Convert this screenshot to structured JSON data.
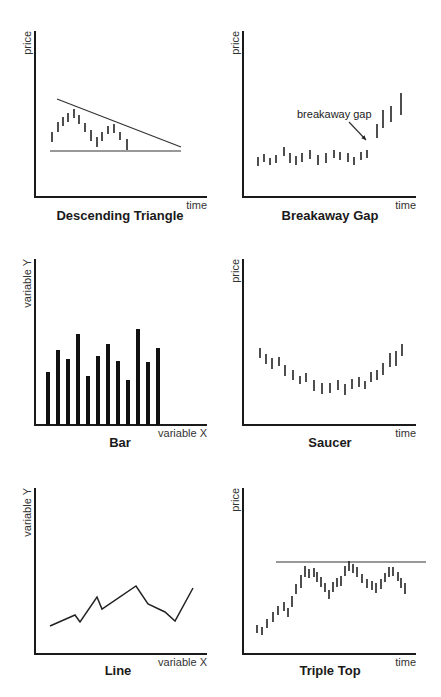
{
  "chart_data": [
    {
      "id": "descending-triangle",
      "type": "bar-range",
      "title": "Descending Triangle",
      "ylabel": "price",
      "xlabel": "time",
      "origin": [
        35,
        197
      ],
      "y_top": 31,
      "x_end": 207,
      "title_pos": [
        120,
        220
      ],
      "ranges": [
        [
          52,
          132,
          142
        ],
        [
          58,
          122,
          132
        ],
        [
          63,
          117,
          126
        ],
        [
          68,
          113,
          122
        ],
        [
          74,
          109,
          118
        ],
        [
          79,
          115,
          124
        ],
        [
          85,
          123,
          132
        ],
        [
          91,
          130,
          141
        ],
        [
          97,
          137,
          147
        ],
        [
          102,
          132,
          141
        ],
        [
          108,
          126,
          134
        ],
        [
          114,
          124,
          133
        ],
        [
          120,
          132,
          140
        ],
        [
          127,
          139,
          150
        ]
      ],
      "lines": [
        [
          57,
          99,
          181,
          147
        ],
        [
          50,
          151,
          181,
          151
        ]
      ]
    },
    {
      "id": "breakaway-gap",
      "type": "bar-range",
      "title": "Breakaway Gap",
      "ylabel": "price",
      "xlabel": "time",
      "origin": [
        243,
        197
      ],
      "y_top": 31,
      "x_end": 416,
      "title_pos": [
        330,
        220
      ],
      "ranges": [
        [
          258,
          157,
          166
        ],
        [
          264,
          154,
          162
        ],
        [
          270,
          158,
          165
        ],
        [
          276,
          155,
          163
        ],
        [
          284,
          147,
          156
        ],
        [
          290,
          153,
          163
        ],
        [
          296,
          156,
          165
        ],
        [
          302,
          153,
          162
        ],
        [
          310,
          150,
          159
        ],
        [
          318,
          155,
          165
        ],
        [
          326,
          153,
          163
        ],
        [
          334,
          150,
          158
        ],
        [
          340,
          152,
          160
        ],
        [
          348,
          153,
          162
        ],
        [
          354,
          157,
          165
        ],
        [
          361,
          152,
          160
        ],
        [
          367,
          150,
          158
        ],
        [
          377,
          124,
          138
        ],
        [
          383,
          110,
          128
        ],
        [
          391,
          106,
          122
        ],
        [
          401,
          93,
          115
        ]
      ],
      "lines": [],
      "annotation": {
        "text": "breakaway gap",
        "pos": [
          297,
          118
        ],
        "arrow": [
          349,
          122,
          366,
          140
        ]
      }
    },
    {
      "id": "bar",
      "type": "bar",
      "title": "Bar",
      "ylabel": "variable Y",
      "xlabel": "variable X",
      "origin": [
        35,
        425
      ],
      "y_top": 259,
      "x_end": 207,
      "title_pos": [
        120,
        447
      ],
      "categories": [
        "1",
        "2",
        "3",
        "4",
        "5",
        "6",
        "7",
        "8",
        "9",
        "10",
        "11",
        "12"
      ],
      "x": [
        48,
        58,
        68,
        78,
        88,
        98,
        108,
        118,
        128,
        138,
        148,
        158
      ],
      "values": [
        53,
        75,
        66,
        91,
        49,
        69,
        81,
        64,
        45,
        96,
        63,
        77
      ],
      "ylim": [
        0,
        166
      ]
    },
    {
      "id": "saucer",
      "type": "bar-range",
      "title": "Saucer",
      "ylabel": "price",
      "xlabel": "time",
      "origin": [
        243,
        425
      ],
      "y_top": 259,
      "x_end": 416,
      "title_pos": [
        330,
        447
      ],
      "ranges": [
        [
          260,
          348,
          358
        ],
        [
          266,
          354,
          364
        ],
        [
          272,
          358,
          369
        ],
        [
          279,
          357,
          366
        ],
        [
          285,
          365,
          376
        ],
        [
          293,
          370,
          380
        ],
        [
          300,
          376,
          384
        ],
        [
          306,
          373,
          382
        ],
        [
          314,
          380,
          391
        ],
        [
          322,
          383,
          394
        ],
        [
          330,
          383,
          393
        ],
        [
          338,
          380,
          390
        ],
        [
          345,
          384,
          395
        ],
        [
          352,
          379,
          389
        ],
        [
          359,
          377,
          387
        ],
        [
          365,
          381,
          389
        ],
        [
          371,
          372,
          382
        ],
        [
          377,
          370,
          380
        ],
        [
          383,
          363,
          375
        ],
        [
          390,
          353,
          367
        ],
        [
          396,
          351,
          366
        ],
        [
          402,
          344,
          356
        ]
      ],
      "lines": []
    },
    {
      "id": "line",
      "type": "line",
      "title": "Line",
      "ylabel": "variable Y",
      "xlabel": "variable X",
      "origin": [
        35,
        654
      ],
      "y_top": 488,
      "x_end": 207,
      "title_pos": [
        118,
        675
      ],
      "points": [
        [
          50,
          626
        ],
        [
          75,
          615
        ],
        [
          80,
          622
        ],
        [
          97,
          597
        ],
        [
          102,
          609
        ],
        [
          136,
          586
        ],
        [
          148,
          604
        ],
        [
          165,
          612
        ],
        [
          175,
          621
        ],
        [
          193,
          588
        ]
      ]
    },
    {
      "id": "triple-top",
      "type": "bar-range",
      "title": "Triple Top",
      "ylabel": "price",
      "xlabel": "time",
      "origin": [
        243,
        654
      ],
      "y_top": 488,
      "x_end": 416,
      "title_pos": [
        330,
        675
      ],
      "ranges": [
        [
          257,
          625,
          633
        ],
        [
          262,
          627,
          635
        ],
        [
          267,
          619,
          628
        ],
        [
          273,
          612,
          622
        ],
        [
          278,
          606,
          615
        ],
        [
          284,
          602,
          611
        ],
        [
          288,
          608,
          617
        ],
        [
          292,
          596,
          607
        ],
        [
          296,
          584,
          594
        ],
        [
          301,
          575,
          588
        ],
        [
          305,
          566,
          577
        ],
        [
          309,
          569,
          578
        ],
        [
          314,
          568,
          577
        ],
        [
          317,
          572,
          582
        ],
        [
          321,
          577,
          587
        ],
        [
          325,
          583,
          592
        ],
        [
          329,
          590,
          599
        ],
        [
          333,
          582,
          592
        ],
        [
          337,
          578,
          587
        ],
        [
          341,
          576,
          586
        ],
        [
          345,
          566,
          576
        ],
        [
          349,
          561,
          571
        ],
        [
          353,
          564,
          573
        ],
        [
          357,
          567,
          577
        ],
        [
          362,
          574,
          583
        ],
        [
          367,
          579,
          588
        ],
        [
          372,
          581,
          590
        ],
        [
          376,
          583,
          593
        ],
        [
          381,
          579,
          589
        ],
        [
          385,
          573,
          582
        ],
        [
          389,
          567,
          577
        ],
        [
          393,
          567,
          576
        ],
        [
          398,
          572,
          581
        ],
        [
          401,
          578,
          588
        ],
        [
          405,
          583,
          594
        ]
      ],
      "lines": [
        [
          276,
          562,
          426,
          562
        ]
      ]
    }
  ]
}
